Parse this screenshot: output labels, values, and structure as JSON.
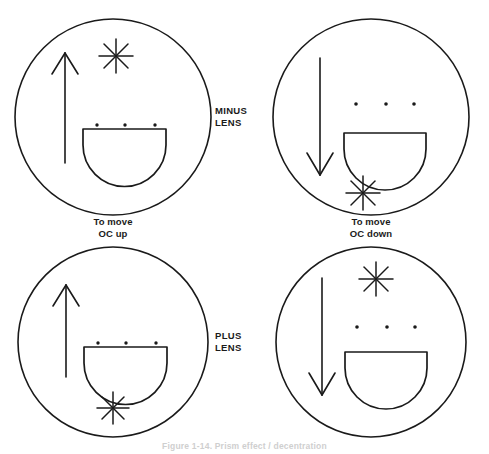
{
  "figure": {
    "caption": "Figure 1-14. Prism effect / decentration",
    "stroke_color": "#1a1a1a",
    "background_color": "#ffffff"
  },
  "row_labels": [
    {
      "id": "minus",
      "text": "MINUS\nLENS"
    },
    {
      "id": "plus",
      "text": "PLUS\nLENS"
    }
  ],
  "cells": [
    {
      "id": "top-left",
      "row": "minus",
      "column": "left",
      "caption": "To move\nOC up",
      "arrow_direction": "up",
      "star_position": "top",
      "dots_attached_to_segment": true,
      "lens_label": "MINUS LENS"
    },
    {
      "id": "top-right",
      "row": "minus",
      "column": "right",
      "caption": "To move\nOC down",
      "arrow_direction": "down",
      "star_position": "bottom",
      "dots_attached_to_segment": false,
      "lens_label": "MINUS LENS"
    },
    {
      "id": "bottom-left",
      "row": "plus",
      "column": "left",
      "caption": "",
      "arrow_direction": "up",
      "star_position": "bottom",
      "dots_attached_to_segment": true,
      "lens_label": "PLUS LENS"
    },
    {
      "id": "bottom-right",
      "row": "plus",
      "column": "right",
      "caption": "",
      "arrow_direction": "down",
      "star_position": "top",
      "dots_attached_to_segment": false,
      "lens_label": "PLUS LENS"
    }
  ],
  "legend": {
    "circle_meaning": "lens outline",
    "bowl_meaning": "bifocal segment",
    "star_meaning": "optical center marker",
    "dots_meaning": "segment reference dots"
  }
}
